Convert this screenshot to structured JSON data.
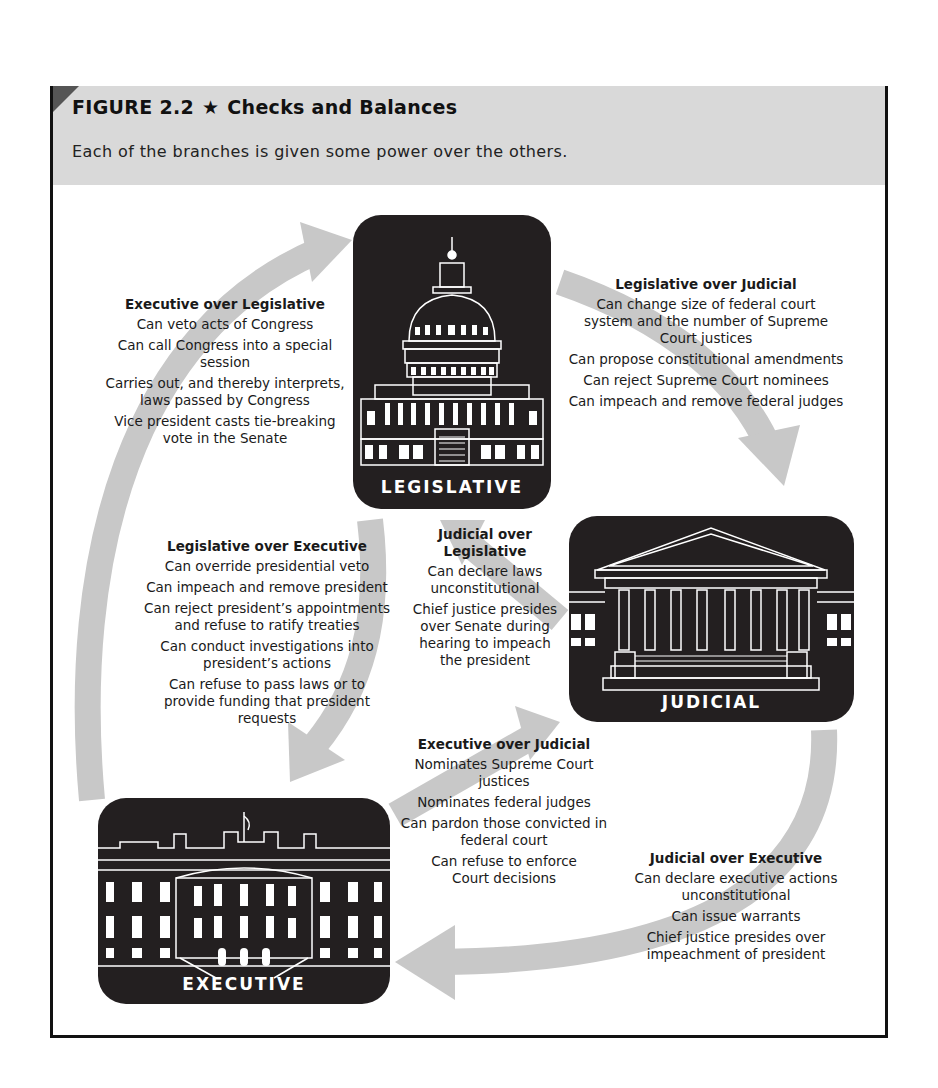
{
  "figure": {
    "number": "FIGURE 2.2",
    "star": "★",
    "title": "Checks and Balances",
    "subtitle": "Each of the branches is given some power over the others."
  },
  "colors": {
    "header_band": "#d9d9d9",
    "corner": "#555555",
    "branch_box": "#231f20",
    "arrow": "#c8c8c8",
    "border": "#111111"
  },
  "branches": {
    "legislative": {
      "label": "LEGISLATIVE",
      "icon": "capitol-building-icon"
    },
    "judicial": {
      "label": "JUDICIAL",
      "icon": "supreme-court-building-icon"
    },
    "executive": {
      "label": "EXECUTIVE",
      "icon": "white-house-icon"
    }
  },
  "checks": {
    "exec_over_leg": {
      "heading": "Executive over Legislative",
      "items": [
        "Can veto acts of Congress",
        "Can call Congress into a special session",
        "Carries out, and thereby interprets, laws passed by Congress",
        "Vice president casts tie-breaking vote in the Senate"
      ]
    },
    "leg_over_jud": {
      "heading": "Legislative over Judicial",
      "items": [
        "Can change size of federal court system and the number of Supreme Court justices",
        "Can propose constitutional amendments",
        "Can reject Supreme Court nominees",
        "Can impeach and remove federal judges"
      ]
    },
    "leg_over_exec": {
      "heading": "Legislative over Executive",
      "items": [
        "Can override presidential veto",
        "Can impeach and remove president",
        "Can reject president’s appointments and refuse to ratify treaties",
        "Can conduct investigations into president’s actions",
        "Can refuse to pass laws or to provide funding that president requests"
      ]
    },
    "jud_over_leg": {
      "heading": "Judicial over Legislative",
      "items": [
        "Can declare laws unconstitutional",
        "Chief justice presides over Senate during hearing to impeach the president"
      ]
    },
    "exec_over_jud": {
      "heading": "Executive over Judicial",
      "items": [
        "Nominates Supreme Court justices",
        "Nominates federal judges",
        "Can pardon those convicted in federal court",
        "Can refuse to enforce Court decisions"
      ]
    },
    "jud_over_exec": {
      "heading": "Judicial over Executive",
      "items": [
        "Can declare executive actions unconstitutional",
        "Can issue warrants",
        "Chief justice presides over impeachment of president"
      ]
    }
  }
}
